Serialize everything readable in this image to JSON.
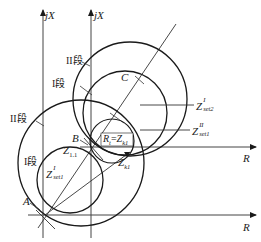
{
  "diagram": {
    "axes": {
      "left_vertical": {
        "label": "jX"
      },
      "right_vertical": {
        "label": "jX"
      },
      "upper_horizontal": {
        "label": "R"
      },
      "lower_horizontal": {
        "label": "R"
      }
    },
    "points": {
      "A": "A",
      "B": "B",
      "C": "C"
    },
    "zone_labels": {
      "upper_zone2": "II段",
      "upper_zone1": "I段",
      "left_zone2": "II段",
      "left_zone1": "I段"
    },
    "setting_labels": {
      "z_set2_I": {
        "main": "Z",
        "sup": "I",
        "sub": "set2"
      },
      "z_set1_II": {
        "main": "Z",
        "sup": "II",
        "sub": "set1"
      },
      "z_set1_I": {
        "main": "Z",
        "sup": "I",
        "sub": "set1"
      }
    },
    "impedance_labels": {
      "z11": {
        "main": "Z",
        "sub": "1.1"
      },
      "zk1": {
        "main": "Z",
        "sub": "k1"
      },
      "rt_eq_zk1": {
        "left_main": "R",
        "left_sub": "t",
        "eq": "=",
        "right_main": "Z",
        "right_sub": "k1"
      }
    },
    "colors": {
      "line": "#1a1a1a",
      "thin_line": "#444444",
      "background": "#ffffff"
    }
  }
}
